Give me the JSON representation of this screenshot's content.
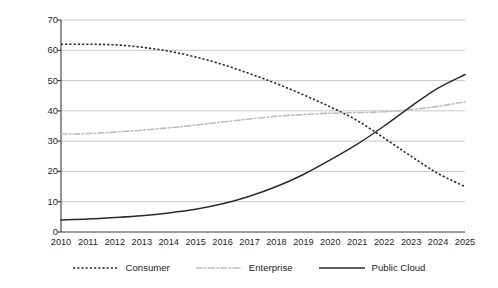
{
  "chart_data": {
    "type": "line",
    "title": "",
    "subtitle": "",
    "xlabel": "",
    "ylabel": "Storage proportion (%)",
    "categories": [
      "2010",
      "2011",
      "2012",
      "2013",
      "2014",
      "2015",
      "2016",
      "2017",
      "2018",
      "2019",
      "2020",
      "2021",
      "2022",
      "2023",
      "2024",
      "2025"
    ],
    "x": [
      2010,
      2011,
      2012,
      2013,
      2014,
      2015,
      2016,
      2017,
      2018,
      2019,
      2020,
      2021,
      2022,
      2023,
      2024,
      2025
    ],
    "ylim": [
      0,
      70
    ],
    "yticks": [
      0,
      10,
      20,
      30,
      40,
      50,
      60,
      70
    ],
    "ytick_labels": [
      "0",
      "10",
      "20",
      "30",
      "40",
      "50",
      "60",
      "70"
    ],
    "grid": true,
    "grid_axis": "y",
    "legend_position": "bottom",
    "series": [
      {
        "name": "Consumer",
        "style": "dotted",
        "color": "#2a2a2a",
        "values": [
          62.0,
          62.0,
          61.8,
          61.0,
          59.7,
          57.8,
          55.3,
          52.3,
          49.0,
          45.3,
          41.3,
          36.8,
          31.0,
          25.0,
          19.3,
          15.0
        ]
      },
      {
        "name": "Enterprise",
        "style": "dash-dot",
        "color": "#bdbdbd",
        "values": [
          32.3,
          32.5,
          33.0,
          33.6,
          34.4,
          35.3,
          36.3,
          37.3,
          38.2,
          38.8,
          39.2,
          39.4,
          39.7,
          40.4,
          41.5,
          43.0
        ]
      },
      {
        "name": "Public Cloud",
        "style": "solid",
        "color": "#2a2a2a",
        "values": [
          4.0,
          4.3,
          4.8,
          5.4,
          6.3,
          7.5,
          9.3,
          11.8,
          15.0,
          19.0,
          23.8,
          29.0,
          35.0,
          41.5,
          47.5,
          52.0
        ]
      }
    ],
    "annotations": []
  },
  "legend": {
    "items": [
      {
        "label": "Consumer",
        "swatch": "dotted-line-swatch"
      },
      {
        "label": "Enterprise",
        "swatch": "dashdot-line-swatch"
      },
      {
        "label": "Public Cloud",
        "swatch": "solid-line-swatch"
      }
    ]
  },
  "axes": {
    "y_axis_title": "Storage proportion (%)"
  }
}
